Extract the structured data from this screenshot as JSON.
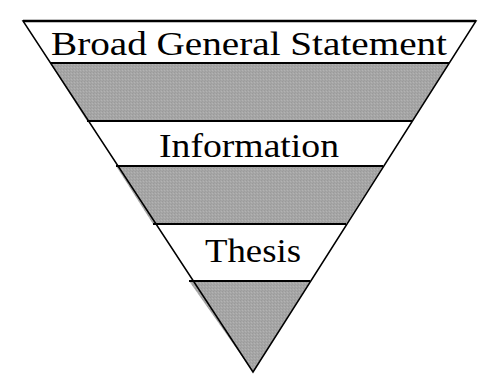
{
  "diagram": {
    "type": "inverted-triangle",
    "colors": {
      "shaded_band": "#a9a9a9",
      "white_band": "#ffffff",
      "outline": "#000000"
    },
    "bands": [
      {
        "label": "Broad General Statement",
        "shaded": false
      },
      {
        "label": "",
        "shaded": true
      },
      {
        "label": "Information",
        "shaded": false
      },
      {
        "label": "",
        "shaded": true
      },
      {
        "label": "Thesis",
        "shaded": false
      },
      {
        "label": "",
        "shaded": true
      }
    ]
  }
}
